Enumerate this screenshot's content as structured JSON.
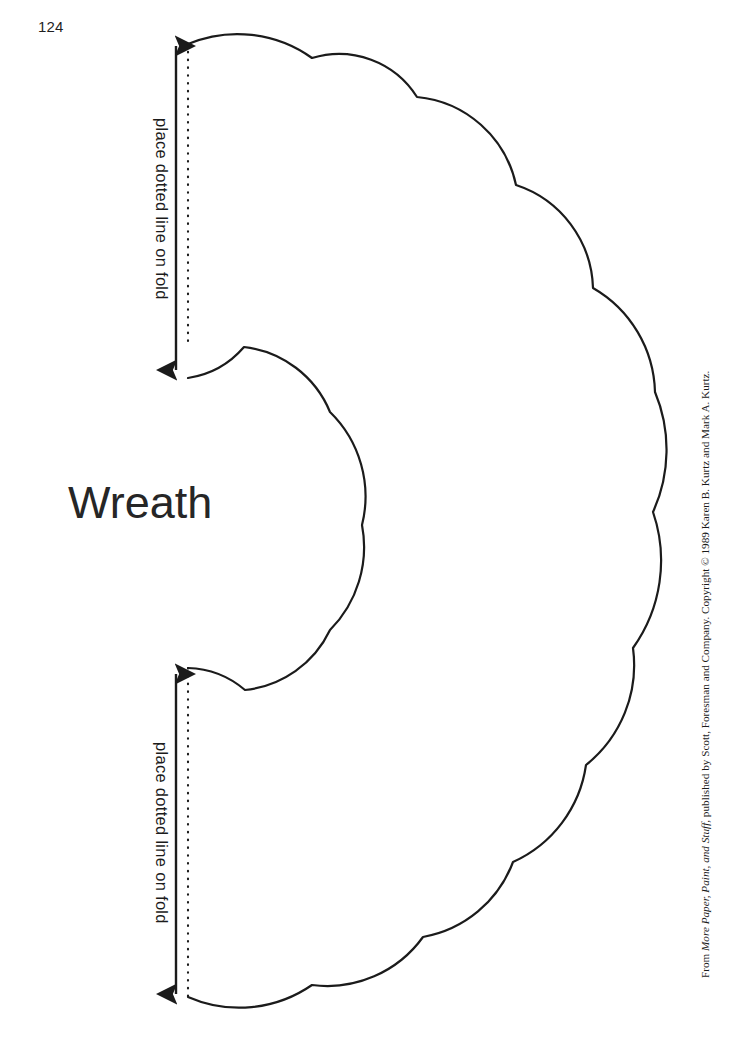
{
  "page": {
    "number": "124",
    "width": 751,
    "height": 1038,
    "background_color": "#ffffff",
    "ink_color": "#1b1b1b"
  },
  "pattern": {
    "title": "Wreath",
    "title_color": "#262626",
    "outline_color": "#1b1b1b",
    "outline_width": 2.2,
    "fold_line_style": "dotted",
    "fold_line_color": "#1b1b1b",
    "description": "Half-wreath cut-out template with scalloped outer edge and scalloped inner edge, to be traced on folded paper"
  },
  "labels": {
    "fold_top": "place dotted line on fold",
    "fold_bottom": "place dotted line on fold"
  },
  "credit": {
    "prefix": "From ",
    "source_title": "More Paper, Paint, and Stuff,",
    "suffix": " published by Scott, Foresman and Company. Copyright © 1989 Karen B. Kurtz and Mark A. Kurtz.",
    "full_text": "From More Paper, Paint, and Stuff, published by Scott, Foresman and Company. Copyright © 1989 Karen B. Kurtz and Mark A. Kurtz."
  },
  "geometry": {
    "fold_axis_x": 188,
    "arrow_axis_x": 176,
    "fold_top_segment": [
      44,
      348
    ],
    "fold_bottom_segment": [
      668,
      997
    ],
    "arrow_top_segment": [
      40,
      376
    ],
    "arrow_bottom_segment": [
      668,
      1000
    ],
    "outer_top_start": [
      188,
      44
    ],
    "outer_bottom_end": [
      188,
      997
    ],
    "rightmost_x": 655,
    "outer_cusps": [
      [
        312,
        58
      ],
      [
        417,
        97
      ],
      [
        516,
        185
      ],
      [
        593,
        288
      ],
      [
        655,
        392
      ],
      [
        653,
        512
      ],
      [
        633,
        648
      ],
      [
        586,
        765
      ],
      [
        513,
        862
      ],
      [
        423,
        937
      ],
      [
        312,
        985
      ]
    ],
    "inner_cusps": [
      [
        244,
        347
      ],
      [
        330,
        412
      ],
      [
        362,
        525
      ],
      [
        330,
        630
      ],
      [
        245,
        690
      ]
    ],
    "inner_top_anchor": [
      188,
      378
    ],
    "inner_bottom_anchor": [
      188,
      668
    ]
  }
}
